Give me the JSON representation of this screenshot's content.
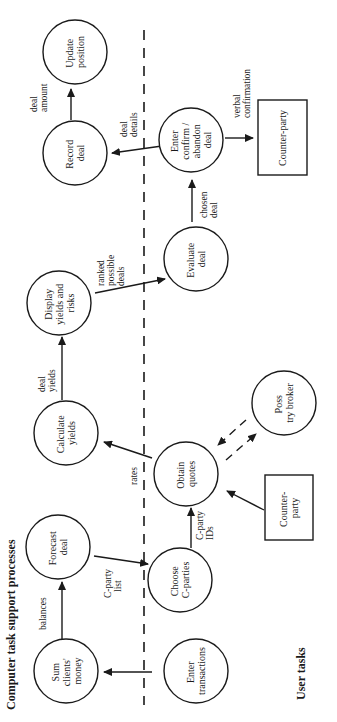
{
  "diagram": {
    "sections": {
      "computer": "Computer task support processes",
      "user": "User tasks"
    },
    "processes": {
      "update_position": [
        "Update",
        "position"
      ],
      "record_deal": [
        "Record",
        "deal"
      ],
      "enter_confirm": [
        "Enter",
        "confirm /",
        "abandon",
        "deal"
      ],
      "evaluate_deal": [
        "Evaluate",
        "deal"
      ],
      "display_yields": [
        "Display",
        "yields and",
        "risks"
      ],
      "calculate_yields": [
        "Calculate",
        "yields"
      ],
      "obtain_quotes": [
        "Obtain",
        "quotes"
      ],
      "poss_try_broker": [
        "Poss",
        "try broker"
      ],
      "forecast_deal": [
        "Forecast",
        "deal"
      ],
      "choose_cparties": [
        "Choose",
        "C-parties"
      ],
      "sum_clients_money": [
        "Sum",
        "clients'",
        "money"
      ],
      "enter_transactions": [
        "Enter",
        "transactions"
      ]
    },
    "externals": {
      "counterparty_top": [
        "Counter-party"
      ],
      "counterparty_bottom": [
        "Counter-",
        "party"
      ]
    },
    "flows": {
      "deal_amount": [
        "deal",
        "amount"
      ],
      "deal_details": [
        "deal",
        "details"
      ],
      "verbal_confirmation": [
        "verbal",
        "confirmation"
      ],
      "chosen_deal": [
        "chosen",
        "deal"
      ],
      "ranked_possible_deals": [
        "ranked",
        "possible",
        "deals"
      ],
      "deal_yields": [
        "deal",
        "yields"
      ],
      "rates": [
        "rates"
      ],
      "cparty_ids": [
        "C-party",
        "IDs"
      ],
      "cparty_list": [
        "C-party",
        "list"
      ],
      "balances": [
        "balances"
      ]
    }
  }
}
